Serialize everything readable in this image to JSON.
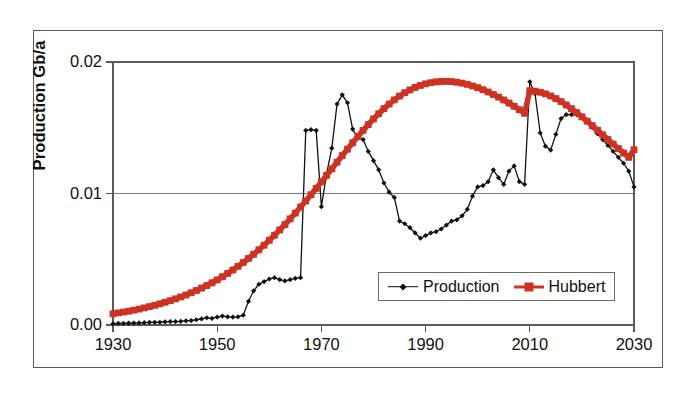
{
  "chart_data": {
    "type": "line",
    "title": "",
    "xlabel": "",
    "ylabel": "Production Gb/a",
    "xlim": [
      1930,
      2030
    ],
    "ylim": [
      0.0,
      0.02
    ],
    "xticks": [
      1930,
      1950,
      1970,
      1990,
      2010,
      2030
    ],
    "xtick_labels": [
      "1930",
      "1950",
      "1970",
      "1990",
      "2010",
      "2030"
    ],
    "yticks": [
      0.0,
      0.01,
      0.02
    ],
    "ytick_labels": [
      "0.00",
      "0.01",
      "0.02"
    ],
    "grid": "horizontal-only",
    "legend_position": "inside-lower-right",
    "legend_entries": [
      "Production",
      "Hubbert"
    ],
    "series": [
      {
        "name": "Production",
        "color": "#111111",
        "marker": "diamond",
        "x": [
          1930,
          1931,
          1932,
          1933,
          1934,
          1935,
          1936,
          1937,
          1938,
          1939,
          1940,
          1941,
          1942,
          1943,
          1944,
          1945,
          1946,
          1947,
          1948,
          1949,
          1950,
          1951,
          1952,
          1953,
          1954,
          1955,
          1956,
          1957,
          1958,
          1959,
          1960,
          1961,
          1962,
          1963,
          1964,
          1965,
          1966,
          1967,
          1968,
          1969,
          1970,
          1971,
          1972,
          1973,
          1974,
          1975,
          1976,
          1977,
          1978,
          1979,
          1980,
          1981,
          1982,
          1983,
          1984,
          1985,
          1986,
          1987,
          1988,
          1989,
          1990,
          1991,
          1992,
          1993,
          1994,
          1995,
          1996,
          1997,
          1998,
          1999,
          2000,
          2001,
          2002,
          2003,
          2004,
          2005,
          2006,
          2007,
          2008,
          2009,
          2010,
          2011,
          2012,
          2013,
          2014,
          2015,
          2016,
          2017,
          2018,
          2019,
          2020,
          2021,
          2022,
          2023,
          2024,
          2025,
          2026,
          2027,
          2028,
          2029,
          2030
        ],
        "y": [
          0.0001,
          0.00012,
          0.00012,
          0.00014,
          0.00015,
          0.00016,
          0.00018,
          0.0002,
          0.0002,
          0.00021,
          0.00024,
          0.00026,
          0.00026,
          0.00028,
          0.00032,
          0.00034,
          0.0004,
          0.00046,
          0.00055,
          0.0005,
          0.0006,
          0.00068,
          0.00062,
          0.0006,
          0.00062,
          0.00075,
          0.0018,
          0.0026,
          0.0031,
          0.0033,
          0.0035,
          0.0036,
          0.00345,
          0.00335,
          0.00345,
          0.00355,
          0.0036,
          0.0148,
          0.01485,
          0.0148,
          0.009,
          0.0115,
          0.01345,
          0.0168,
          0.0175,
          0.0169,
          0.0149,
          0.0142,
          0.0141,
          0.0132,
          0.0125,
          0.0118,
          0.0108,
          0.0101,
          0.0097,
          0.0079,
          0.0077,
          0.0074,
          0.007,
          0.0066,
          0.0068,
          0.007,
          0.0071,
          0.0073,
          0.0076,
          0.0079,
          0.008,
          0.0083,
          0.0088,
          0.0098,
          0.0105,
          0.0106,
          0.0109,
          0.0118,
          0.0112,
          0.0107,
          0.0117,
          0.0121,
          0.0109,
          0.0107,
          0.0185,
          0.0176,
          0.0146,
          0.0136,
          0.0133,
          0.0145,
          0.0157,
          0.016,
          0.016,
          0.016,
          0.01585,
          0.01545,
          0.015,
          0.01455,
          0.0141,
          0.01365,
          0.0132,
          0.01275,
          0.0123,
          0.0117,
          0.0105
        ]
      },
      {
        "name": "Hubbert",
        "color": "#CC3322",
        "marker": "square",
        "x": [
          1930,
          1931,
          1932,
          1933,
          1934,
          1935,
          1936,
          1937,
          1938,
          1939,
          1940,
          1941,
          1942,
          1943,
          1944,
          1945,
          1946,
          1947,
          1948,
          1949,
          1950,
          1951,
          1952,
          1953,
          1954,
          1955,
          1956,
          1957,
          1958,
          1959,
          1960,
          1961,
          1962,
          1963,
          1964,
          1965,
          1966,
          1967,
          1968,
          1969,
          1970,
          1971,
          1972,
          1973,
          1974,
          1975,
          1976,
          1977,
          1978,
          1979,
          1980,
          1981,
          1982,
          1983,
          1984,
          1985,
          1986,
          1987,
          1988,
          1989,
          1990,
          1991,
          1992,
          1993,
          1994,
          1995,
          1996,
          1997,
          1998,
          1999,
          2000,
          2001,
          2002,
          2003,
          2004,
          2005,
          2006,
          2007,
          2008,
          2009,
          2010,
          2011,
          2012,
          2013,
          2014,
          2015,
          2016,
          2017,
          2018,
          2019,
          2020,
          2021,
          2022,
          2023,
          2024,
          2025,
          2026,
          2027,
          2028,
          2029,
          2030
        ],
        "y": [
          0.00085,
          0.00092,
          0.00098,
          0.00105,
          0.00113,
          0.00121,
          0.0013,
          0.0014,
          0.0015,
          0.00161,
          0.00173,
          0.00185,
          0.00199,
          0.00213,
          0.00228,
          0.00245,
          0.00262,
          0.00281,
          0.003,
          0.00321,
          0.00343,
          0.00367,
          0.00392,
          0.00418,
          0.00446,
          0.00475,
          0.00506,
          0.00538,
          0.00572,
          0.00607,
          0.00644,
          0.00683,
          0.00723,
          0.00764,
          0.00807,
          0.00851,
          0.00897,
          0.00943,
          0.00991,
          0.01039,
          0.01088,
          0.01138,
          0.01188,
          0.01238,
          0.01288,
          0.01337,
          0.01386,
          0.01434,
          0.0148,
          0.01524,
          0.01567,
          0.01607,
          0.01645,
          0.0168,
          0.01712,
          0.01741,
          0.01766,
          0.01788,
          0.01807,
          0.01822,
          0.01834,
          0.01843,
          0.01849,
          0.01852,
          0.01853,
          0.01851,
          0.01846,
          0.01839,
          0.0183,
          0.01818,
          0.01805,
          0.01789,
          0.01772,
          0.01753,
          0.01733,
          0.01711,
          0.01688,
          0.01663,
          0.01637,
          0.0161,
          0.01782,
          0.01778,
          0.0177,
          0.01758,
          0.01742,
          0.01722,
          0.01699,
          0.01673,
          0.01645,
          0.01615,
          0.01583,
          0.0155,
          0.01516,
          0.01481,
          0.01446,
          0.01411,
          0.01376,
          0.01342,
          0.01308,
          0.01275,
          0.01333
        ]
      }
    ]
  },
  "axes": {
    "y_title": "Production Gb/a",
    "y_ticks": [
      {
        "label": "0.02",
        "value": 0.02
      },
      {
        "label": "0.01",
        "value": 0.01
      },
      {
        "label": "0.00",
        "value": 0.0
      }
    ],
    "x_ticks": [
      {
        "label": "1930",
        "value": 1930
      },
      {
        "label": "1950",
        "value": 1950
      },
      {
        "label": "1970",
        "value": 1970
      },
      {
        "label": "1990",
        "value": 1990
      },
      {
        "label": "2010",
        "value": 2010
      },
      {
        "label": "2030",
        "value": 2030
      }
    ]
  },
  "legend": {
    "items": [
      {
        "label": "Production",
        "color": "#111111",
        "marker": "diamond-marker-icon"
      },
      {
        "label": "Hubbert",
        "color": "#CC3322",
        "marker": "square-marker-icon"
      }
    ]
  },
  "colors": {
    "production": "#111111",
    "hubbert": "#CC3322",
    "axis": "#5a5a5a",
    "grid": "#7a7a7a",
    "frame": "#5a5a5a",
    "text": "#111111",
    "background": "#ffffff"
  }
}
